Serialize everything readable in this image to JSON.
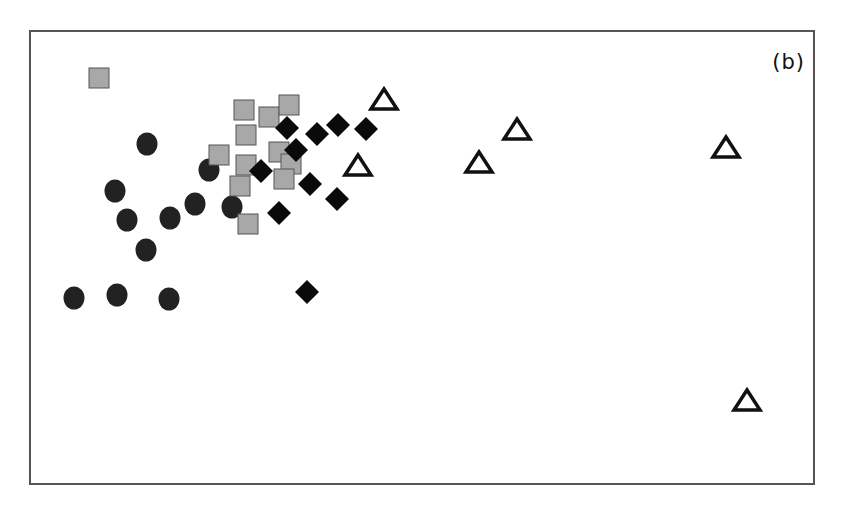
{
  "chart_data": {
    "type": "scatter",
    "title": "",
    "panel_label": "(b)",
    "xlabel": "",
    "ylabel": "",
    "grid": false,
    "legend": null,
    "axes": "frame only, no tick labels",
    "coordinate_system": "pixel coordinates relative to plot frame (x right 0-782, y down 0-451)",
    "series": [
      {
        "name": "filled-circles",
        "marker": "circle",
        "fill": "#222222",
        "stroke": "#222222",
        "points": [
          [
            116,
            112
          ],
          [
            84,
            159
          ],
          [
            96,
            188
          ],
          [
            139,
            186
          ],
          [
            164,
            172
          ],
          [
            178,
            138
          ],
          [
            201,
            175
          ],
          [
            115,
            218
          ],
          [
            43,
            266
          ],
          [
            86,
            263
          ],
          [
            138,
            267
          ]
        ]
      },
      {
        "name": "grey-squares",
        "marker": "square",
        "fill": "#a8a8a8",
        "stroke": "#555555",
        "points": [
          [
            68,
            46
          ],
          [
            213,
            78
          ],
          [
            238,
            85
          ],
          [
            258,
            73
          ],
          [
            215,
            103
          ],
          [
            188,
            123
          ],
          [
            248,
            120
          ],
          [
            260,
            132
          ],
          [
            215,
            133
          ],
          [
            253,
            147
          ],
          [
            209,
            154
          ],
          [
            217,
            192
          ]
        ]
      },
      {
        "name": "black-diamonds",
        "marker": "diamond",
        "fill": "#0a0a0a",
        "stroke": "#0a0a0a",
        "points": [
          [
            256,
            96
          ],
          [
            286,
            102
          ],
          [
            307,
            93
          ],
          [
            335,
            97
          ],
          [
            265,
            118
          ],
          [
            230,
            139
          ],
          [
            279,
            152
          ],
          [
            306,
            167
          ],
          [
            248,
            181
          ],
          [
            276,
            260
          ]
        ]
      },
      {
        "name": "open-triangles",
        "marker": "triangle",
        "fill": "#ffffff",
        "stroke": "#111111",
        "points": [
          [
            353,
            67
          ],
          [
            327,
            133
          ],
          [
            448,
            130
          ],
          [
            486,
            97
          ],
          [
            695,
            115
          ],
          [
            716,
            368
          ]
        ]
      }
    ]
  }
}
